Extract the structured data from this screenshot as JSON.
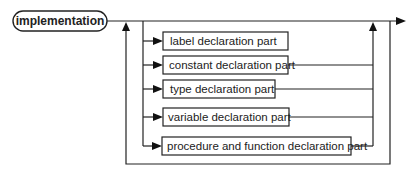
{
  "diagram": {
    "type": "syntax-diagram",
    "terminal": {
      "label": "implementation"
    },
    "alternatives": [
      {
        "label": "label declaration part"
      },
      {
        "label": "constant declaration part"
      },
      {
        "label": "type declaration part"
      },
      {
        "label": "variable declaration part"
      },
      {
        "label": "procedure and function declaration part"
      }
    ],
    "colors": {
      "stroke": "#222222",
      "background": "#ffffff"
    }
  }
}
